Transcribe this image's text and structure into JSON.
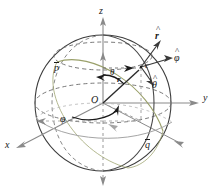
{
  "figure": {
    "type": "spherical-coordinate-diagram",
    "title": "",
    "background": "#ffffff"
  },
  "colors": {
    "sphere_outline": "#3d3d3d",
    "dashed_guide": "#5a5a5a",
    "axis": "#8a8a8a",
    "vector_dark": "#2b2b2b",
    "great_circle_q": "#9aa06a",
    "great_circle_p": "#8a8a8a",
    "label": "#1a1a1a"
  },
  "axes": {
    "z": {
      "label": "z",
      "x": 102,
      "y": 12
    },
    "y": {
      "label": "y",
      "x": 205,
      "y": 98
    },
    "x": {
      "label": "x",
      "x": 7,
      "y": 146
    },
    "z_negative_dashed": true
  },
  "points": {
    "origin": {
      "label": "O",
      "x": 95,
      "y": 100
    },
    "surface_point": {
      "label": "c",
      "x": 144,
      "y": 66
    }
  },
  "vectors": {
    "position": {
      "label": "r",
      "x": 119,
      "y": 79,
      "bold": true
    },
    "r_hat": {
      "label": "r",
      "hat": "^",
      "x": 157,
      "y": 36
    },
    "theta_hat": {
      "label": "θ",
      "hat": "^",
      "x": 152,
      "y": 84
    },
    "phi_hat": {
      "label": "φ",
      "hat": "^",
      "x": 172,
      "y": 57
    }
  },
  "angles": {
    "theta": {
      "label": "θ",
      "x": 111,
      "y": 70
    },
    "phi": {
      "label": "φ",
      "x": 62,
      "y": 119
    }
  },
  "circles": {
    "p": {
      "label": "p",
      "bar": true,
      "x": 55,
      "y": 66
    },
    "q": {
      "label": "q",
      "bar": true,
      "x": 146,
      "y": 144
    }
  }
}
